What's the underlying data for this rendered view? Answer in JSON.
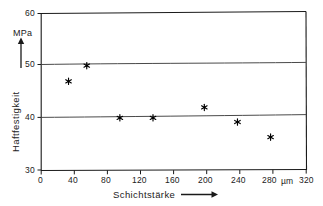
{
  "chart_data": {
    "type": "scatter",
    "title": "",
    "xlabel": "Schichtstärke",
    "ylabel": "Haftfestigkeit",
    "x_unit": "µm",
    "y_unit": "MPa",
    "xlim": [
      0,
      320
    ],
    "ylim": [
      30,
      60
    ],
    "xticks": [
      0,
      40,
      80,
      120,
      160,
      200,
      240,
      280,
      320
    ],
    "xtick_labels": [
      "0",
      "40",
      "80",
      "120",
      "160",
      "200",
      "240",
      "280",
      "320"
    ],
    "yticks": [
      30,
      40,
      50,
      60
    ],
    "ytick_labels": [
      "30",
      "40",
      "50",
      "60"
    ],
    "grid": "horizontal-at-40-and-50",
    "legend": "none",
    "marker": "asterisk-star",
    "points": [
      {
        "x": 33,
        "y": 47.0
      },
      {
        "x": 55,
        "y": 50.0
      },
      {
        "x": 95,
        "y": 40.0
      },
      {
        "x": 135,
        "y": 40.0
      },
      {
        "x": 197,
        "y": 42.0
      },
      {
        "x": 237,
        "y": 39.2
      },
      {
        "x": 277,
        "y": 36.3
      }
    ],
    "gridline_values": [
      40,
      50
    ],
    "axis_arrow_x": "right-arrow",
    "axis_arrow_y": "up-arrow"
  },
  "axes": {
    "y_unit_label": "MPa",
    "y_title": "Haftfestigkeit",
    "x_title": "Schichtstärke",
    "x_unit_label": "µm"
  },
  "ticks": {
    "y": [
      "60",
      "50",
      "40",
      "30"
    ],
    "x": [
      "0",
      "40",
      "80",
      "120",
      "160",
      "200",
      "240",
      "280",
      "320"
    ]
  },
  "colors": {
    "frame": "#1a1a1a",
    "gridline": "#555555",
    "marker": "#000000",
    "background": "#ffffff"
  }
}
